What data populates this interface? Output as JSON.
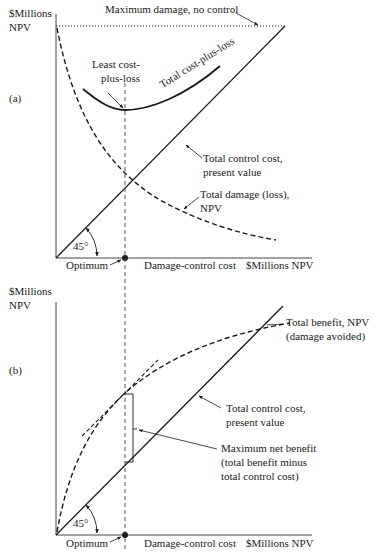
{
  "panel_a": {
    "tag": "(a)",
    "y_axis_label_line1": "$Millions",
    "y_axis_label_line2": "NPV",
    "x_axis_label": "Damage-control cost",
    "x_axis_unit": "$Millions NPV",
    "optimum_label": "Optimum",
    "angle_label": "45°",
    "max_damage_label": "Maximum damage, no control",
    "least_cost_label_line1": "Least cost-",
    "least_cost_label_line2": "plus-loss",
    "total_cost_plus_loss_label": "Total cost-plus-loss",
    "control_cost_label_line1": "Total control cost,",
    "control_cost_label_line2": "present value",
    "damage_label_line1": "Total damage (loss),",
    "damage_label_line2": "NPV"
  },
  "panel_b": {
    "tag": "(b)",
    "y_axis_label_line1": "$Millions",
    "y_axis_label_line2": "NPV",
    "x_axis_label": "Damage-control cost",
    "x_axis_unit": "$Millions NPV",
    "optimum_label": "Optimum",
    "angle_label": "45°",
    "benefit_label_line1": "Total benefit, NPV",
    "benefit_label_line2": "(damage avoided)",
    "control_cost_label_line1": "Total control cost,",
    "control_cost_label_line2": "present value",
    "net_benefit_label_line1": "Maximum net benefit",
    "net_benefit_label_line2": "(total benefit minus",
    "net_benefit_label_line3": "total control cost)"
  },
  "colors": {
    "ink": "#1a1a1a",
    "guide": "#555555",
    "background": "#ffffff"
  }
}
